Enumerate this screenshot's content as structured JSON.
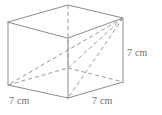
{
  "figure": {
    "shape_name": "cube",
    "stroke_color": "#8c8c8c",
    "hidden_stroke_color": "#9a9a9a",
    "background_color": "#ffffff",
    "label_color": "#6f6f6f"
  },
  "labels": {
    "height": "7 cm",
    "depth": "7 cm",
    "width": "7 cm"
  },
  "vertices": {
    "front_top_left": "8,22",
    "front_top_right": "68,38",
    "back_top_left": "68,5",
    "back_top_right": "123,18",
    "front_bottom_left": "8,85",
    "front_bottom_right": "68,98",
    "back_bottom_left": "68,68",
    "back_bottom_right": "123,82"
  }
}
